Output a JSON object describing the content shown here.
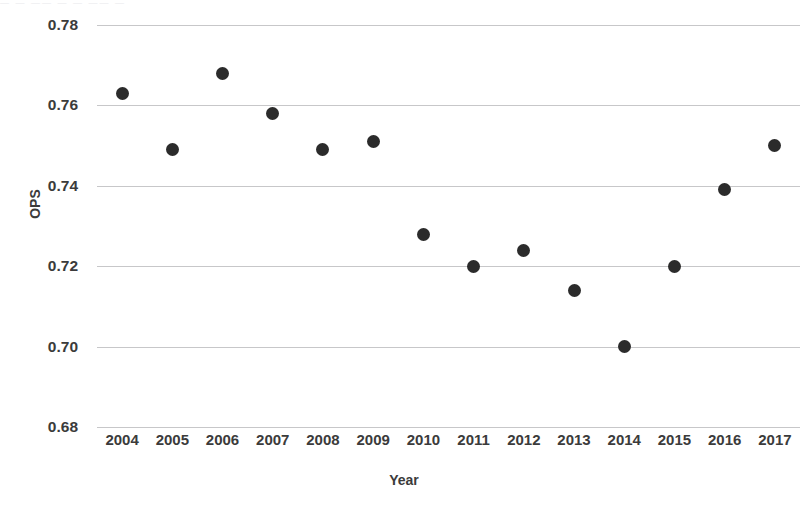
{
  "chart_data": {
    "type": "scatter",
    "title": "",
    "xlabel": "Year",
    "ylabel": "OPS",
    "x": [
      2004,
      2005,
      2006,
      2007,
      2008,
      2009,
      2010,
      2011,
      2012,
      2013,
      2014,
      2015,
      2016,
      2017
    ],
    "values": [
      0.763,
      0.749,
      0.768,
      0.758,
      0.749,
      0.751,
      0.728,
      0.72,
      0.724,
      0.714,
      0.7,
      0.72,
      0.739,
      0.75
    ],
    "categories": [
      "2004",
      "2005",
      "2006",
      "2007",
      "2008",
      "2009",
      "2010",
      "2011",
      "2012",
      "2013",
      "2014",
      "2015",
      "2016",
      "2017"
    ],
    "xlim": [
      2003.5,
      2017.5
    ],
    "ylim": [
      0.68,
      0.78
    ],
    "ytick_values": [
      0.78,
      0.76,
      0.74,
      0.72,
      0.7,
      0.68
    ],
    "ytick_labels": [
      "0.78",
      "0.76",
      "0.74",
      "0.72",
      "0.70",
      "0.68"
    ],
    "xtick_labels": [
      "2004",
      "2005",
      "2006",
      "2007",
      "2008",
      "2009",
      "2010",
      "2011",
      "2012",
      "2013",
      "2014",
      "2015",
      "2016",
      "2017"
    ],
    "grid": "horizontal-only",
    "legend": "none",
    "marker": "filled-circle",
    "marker_color": "#2b2b2b",
    "gridline_color": "#c7c7c9",
    "background_color": "#ffffff",
    "text_color": "#3b3b3b",
    "points": [
      {
        "year": "2004",
        "ops": 0.763
      },
      {
        "year": "2005",
        "ops": 0.749
      },
      {
        "year": "2006",
        "ops": 0.768
      },
      {
        "year": "2007",
        "ops": 0.758
      },
      {
        "year": "2008",
        "ops": 0.749
      },
      {
        "year": "2009",
        "ops": 0.751
      },
      {
        "year": "2010",
        "ops": 0.728
      },
      {
        "year": "2011",
        "ops": 0.72
      },
      {
        "year": "2012",
        "ops": 0.724
      },
      {
        "year": "2013",
        "ops": 0.714
      },
      {
        "year": "2014",
        "ops": 0.7
      },
      {
        "year": "2015",
        "ops": 0.72
      },
      {
        "year": "2016",
        "ops": 0.739
      },
      {
        "year": "2017",
        "ops": 0.75
      }
    ]
  }
}
